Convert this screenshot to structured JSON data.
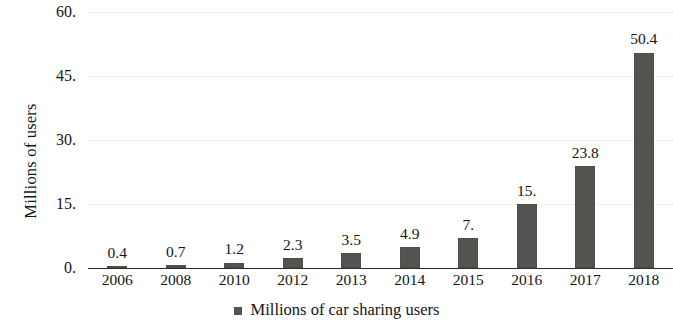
{
  "chart_data": {
    "type": "bar",
    "title": "",
    "subtitle": "",
    "xlabel": "",
    "ylabel": "Millions of users",
    "categories": [
      "2006",
      "2008",
      "2010",
      "2012",
      "2013",
      "2014",
      "2015",
      "2016",
      "2017",
      "2018"
    ],
    "values": [
      0.4,
      0.7,
      1.2,
      2.3,
      3.5,
      4.9,
      7,
      15,
      23.8,
      50.4
    ],
    "value_labels": [
      "0.4",
      "0.7",
      "1.2",
      "2.3",
      "3.5",
      "4.9",
      "7.",
      "15.",
      "23.8",
      "50.4"
    ],
    "series": [
      {
        "name": "Millions of car sharing users",
        "values": [
          0.4,
          0.7,
          1.2,
          2.3,
          3.5,
          4.9,
          7,
          15,
          23.8,
          50.4
        ],
        "color": "#53534f"
      }
    ],
    "ylim": [
      0,
      60
    ],
    "yticks": [
      0,
      15,
      30,
      45,
      60
    ],
    "ytick_labels": [
      "0.",
      "15.",
      "30.",
      "45.",
      "60."
    ],
    "grid": true,
    "grid_axis": "y",
    "grid_color": "#e3e3e3",
    "legend": {
      "position": "bottom",
      "entries": [
        {
          "label": "Millions of car sharing users",
          "color": "#53534f",
          "marker": "square"
        }
      ]
    },
    "background_color": "#ffffff",
    "text_color": "#141414",
    "axis_color": "#2d2d2d"
  }
}
